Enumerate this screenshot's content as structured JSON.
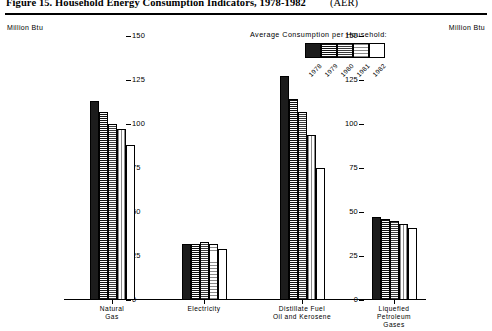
{
  "figure": {
    "title": "Figure 15.  Household Energy Consumption Indicators, 1978-1982",
    "source_note": "(AER)"
  },
  "axes": {
    "unit_left": "Million Btu",
    "unit_right": "Million Btu"
  },
  "legend": {
    "title": "Average Consumption per Household:",
    "entries": [
      {
        "year": "1978",
        "pattern": "solid-black"
      },
      {
        "year": "1979",
        "pattern": "horizontal-lines"
      },
      {
        "year": "1980",
        "pattern": "dotted-gray"
      },
      {
        "year": "1981",
        "pattern": "fine-grid"
      },
      {
        "year": "1982",
        "pattern": "white"
      }
    ]
  },
  "chart_data": {
    "type": "bar",
    "title": "Figure 15.  Household Energy Consumption Indicators, 1978-1982",
    "xlabel": "",
    "ylabel": "Million Btu",
    "ylim": [
      0,
      150
    ],
    "yticks": [
      0,
      25,
      50,
      75,
      100,
      125,
      150
    ],
    "ytick_labels": [
      "0",
      "25",
      "50",
      "75",
      "100",
      "125",
      "150"
    ],
    "grid": false,
    "legend_position": "top-right",
    "categories": [
      "Natural\nGas",
      "Electricity",
      "Distillate Fuel\nOil and Kerosene",
      "Liquefied\nPetroleum\nGases"
    ],
    "series": [
      {
        "name": "1978",
        "values": [
          113,
          32,
          127,
          47
        ]
      },
      {
        "name": "1979",
        "values": [
          107,
          32,
          114,
          46
        ]
      },
      {
        "name": "1980",
        "values": [
          100,
          33,
          107,
          45
        ]
      },
      {
        "name": "1981",
        "values": [
          97,
          32,
          94,
          43
        ]
      },
      {
        "name": "1982",
        "values": [
          88,
          29,
          75,
          41
        ]
      }
    ]
  }
}
